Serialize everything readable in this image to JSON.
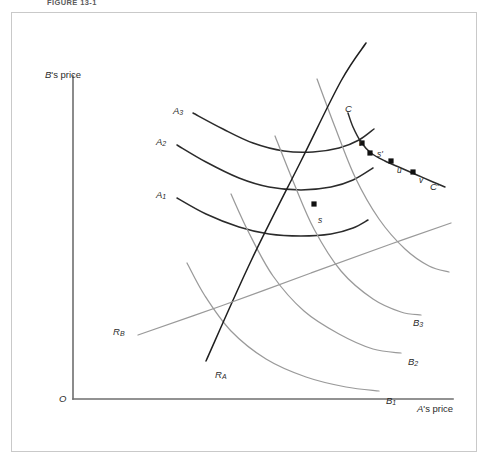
{
  "figure": {
    "caption": "FIGURE 13-1",
    "background_color": "#ffffff",
    "frame_color": "#c9c9c9"
  },
  "axes": {
    "origin_label": "O",
    "y_axis_label_owner": "B",
    "y_axis_label": "B's price",
    "x_axis_label_owner": "A",
    "x_axis_label": "A's price",
    "axis_color": "#6e6e6e"
  },
  "colors": {
    "curve_a": "#2b2b2b",
    "curve_b": "#9a9a9a",
    "reaction_a": "#1f1f1f",
    "reaction_b": "#9a9a9a",
    "contract_curve": "#2b2b2b",
    "point_marker": "#111111"
  },
  "chart_data": {
    "type": "line",
    "title": "FIGURE 13-1",
    "xlabel": "A's price",
    "ylabel": "B's price",
    "grid": false,
    "legend": "none",
    "series": [
      {
        "name": "A1",
        "label": "A₁",
        "role": "isoprofit-curve-firm-a",
        "color": "#2b2b2b",
        "label_at": [
          155,
          188
        ],
        "points": [
          [
            176,
            197
          ],
          [
            205,
            213
          ],
          [
            238,
            226
          ],
          [
            268,
            233
          ],
          [
            300,
            235
          ],
          [
            330,
            233
          ],
          [
            352,
            227
          ],
          [
            367,
            219
          ]
        ]
      },
      {
        "name": "A2",
        "label": "A₂",
        "role": "isoprofit-curve-firm-a",
        "color": "#2b2b2b",
        "label_at": [
          155,
          135
        ],
        "points": [
          [
            176,
            144
          ],
          [
            205,
            161
          ],
          [
            238,
            177
          ],
          [
            268,
            186
          ],
          [
            300,
            189
          ],
          [
            330,
            186
          ],
          [
            352,
            179
          ],
          [
            372,
            167
          ]
        ]
      },
      {
        "name": "A3",
        "label": "A₃",
        "role": "isoprofit-curve-firm-a",
        "color": "#2b2b2b",
        "label_at": [
          172,
          104
        ],
        "points": [
          [
            192,
            112
          ],
          [
            222,
            128
          ],
          [
            252,
            142
          ],
          [
            283,
            150
          ],
          [
            312,
            151
          ],
          [
            338,
            147
          ],
          [
            358,
            139
          ],
          [
            373,
            128
          ]
        ]
      },
      {
        "name": "B1",
        "label": "B₁",
        "role": "isoprofit-curve-firm-b",
        "color": "#9a9a9a",
        "label_at": [
          385,
          394
        ],
        "points": [
          [
            186,
            262
          ],
          [
            204,
            295
          ],
          [
            230,
            330
          ],
          [
            265,
            358
          ],
          [
            305,
            376
          ],
          [
            345,
            386
          ],
          [
            378,
            390
          ]
        ]
      },
      {
        "name": "B2",
        "label": "B₂",
        "role": "isoprofit-curve-firm-b",
        "color": "#9a9a9a",
        "label_at": [
          407,
          355
        ],
        "points": [
          [
            230,
            193
          ],
          [
            248,
            232
          ],
          [
            272,
            275
          ],
          [
            303,
            310
          ],
          [
            338,
            333
          ],
          [
            372,
            348
          ],
          [
            400,
            352
          ]
        ]
      },
      {
        "name": "B3",
        "label": "B₃",
        "role": "isoprofit-curve-firm-b",
        "color": "#9a9a9a",
        "label_at": [
          412,
          316
        ],
        "points": [
          [
            274,
            135
          ],
          [
            292,
            180
          ],
          [
            313,
            228
          ],
          [
            340,
            270
          ],
          [
            372,
            298
          ],
          [
            400,
            311
          ],
          [
            420,
            314
          ]
        ]
      },
      {
        "name": "B4",
        "label": "",
        "role": "isoprofit-curve-firm-b",
        "color": "#9a9a9a",
        "points": [
          [
            316,
            78
          ],
          [
            334,
            126
          ],
          [
            354,
            176
          ],
          [
            378,
            218
          ],
          [
            404,
            248
          ],
          [
            428,
            265
          ],
          [
            448,
            271
          ]
        ]
      },
      {
        "name": "RA",
        "label": "Rₐ",
        "role": "reaction-function-firm-a",
        "color": "#1f1f1f",
        "label_at": [
          214,
          368
        ],
        "points": [
          [
            205,
            360
          ],
          [
            250,
            260
          ],
          [
            300,
            160
          ],
          [
            340,
            80
          ],
          [
            365,
            42
          ]
        ]
      },
      {
        "name": "RB",
        "label": "Rᵦ",
        "role": "reaction-function-firm-b",
        "color": "#9a9a9a",
        "label_at": [
          112,
          325
        ],
        "points": [
          [
            137,
            334
          ],
          [
            220,
            305
          ],
          [
            310,
            272
          ],
          [
            390,
            243
          ],
          [
            450,
            222
          ]
        ]
      },
      {
        "name": "CC",
        "label_start": "C",
        "label_end": "C'",
        "role": "contract-curve",
        "color": "#2b2b2b",
        "label_start_at": [
          344,
          102
        ],
        "label_end_at": [
          429,
          180
        ],
        "points": [
          [
            347,
            112
          ],
          [
            352,
            126
          ],
          [
            360,
            141
          ],
          [
            370,
            152
          ],
          [
            384,
            160
          ],
          [
            400,
            167
          ],
          [
            416,
            174
          ],
          [
            432,
            181
          ],
          [
            444,
            186
          ]
        ]
      }
    ],
    "points": [
      {
        "name": "s",
        "label": "s",
        "x": 313,
        "y": 203,
        "label_dx": 4,
        "label_dy": 11,
        "marker": "square"
      },
      {
        "name": "t",
        "label": "t",
        "x": 361,
        "y": 142,
        "label_dx": -3,
        "label_dy": -5,
        "marker": "square"
      },
      {
        "name": "s_prime_dot",
        "label": "",
        "x": 369,
        "y": 152,
        "label_dx": 0,
        "label_dy": 0,
        "marker": "square"
      },
      {
        "name": "s_prime",
        "label": "s'",
        "x": 369,
        "y": 152,
        "label_dx": 7,
        "label_dy": -4,
        "marker": "none"
      },
      {
        "name": "u",
        "label": "u",
        "x": 390,
        "y": 160,
        "label_dx": 6,
        "label_dy": 4,
        "marker": "square"
      },
      {
        "name": "v",
        "label": "v",
        "x": 412,
        "y": 171,
        "label_dx": 6,
        "label_dy": 3,
        "marker": "square"
      }
    ],
    "axis_geometry": {
      "x_axis": {
        "x1": 72,
        "y1": 398,
        "x2": 452,
        "y2": 398
      },
      "y_axis": {
        "x1": 72,
        "y1": 398,
        "x2": 72,
        "y2": 75
      }
    }
  }
}
